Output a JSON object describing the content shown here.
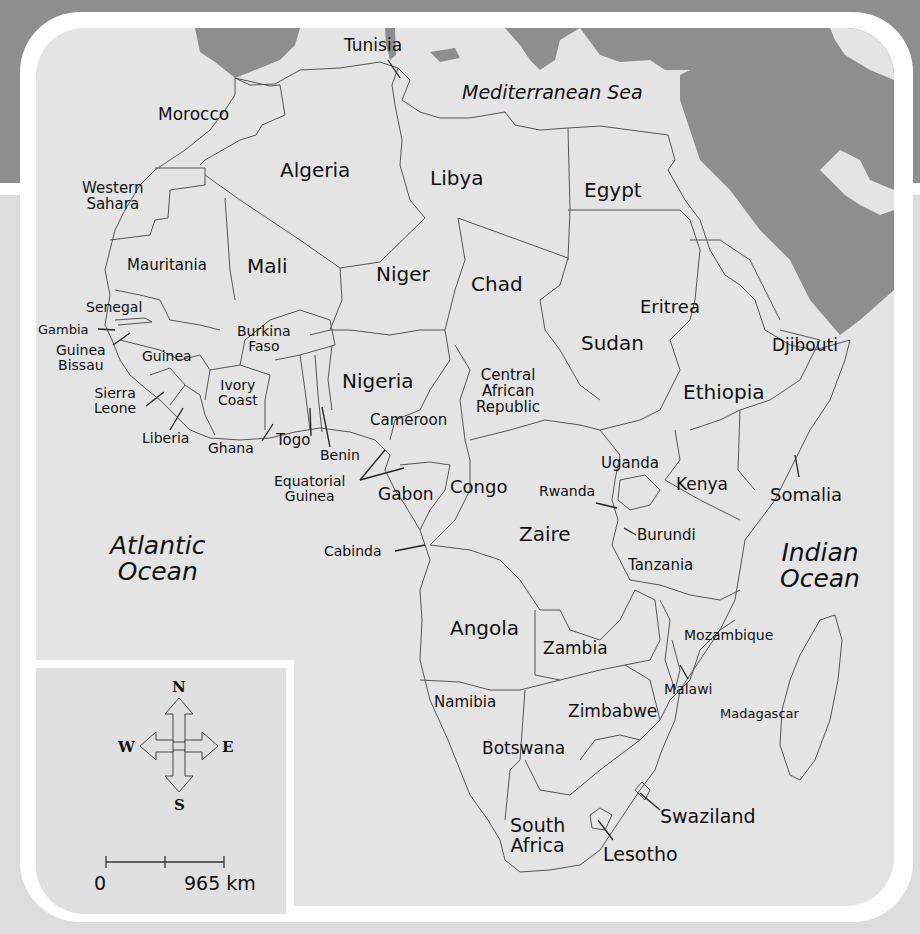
{
  "map": {
    "title": "Africa",
    "colors": {
      "water": "#8e8e8e",
      "land": "#e4e4e4",
      "frame": "#ffffff",
      "border": "#555555",
      "text": "#111111"
    },
    "water_labels": {
      "mediterranean": "Mediterranean Sea",
      "atlantic": [
        "Atlantic",
        "Ocean"
      ],
      "indian": [
        "Indian",
        "Ocean"
      ]
    },
    "countries": {
      "tunisia": "Tunisia",
      "morocco": "Morocco",
      "algeria": "Algeria",
      "libya": "Libya",
      "egypt": "Egypt",
      "western_sahara": [
        "Western",
        "Sahara"
      ],
      "mauritania": "Mauritania",
      "mali": "Mali",
      "niger": "Niger",
      "chad": "Chad",
      "eritrea": "Eritrea",
      "sudan": "Sudan",
      "djibouti": "Djibouti",
      "senegal": "Senegal",
      "gambia": "Gambia",
      "guinea_bissau": [
        "Guinea",
        "Bissau"
      ],
      "guinea": "Guinea",
      "burkina_faso": [
        "Burkina",
        "Faso"
      ],
      "sierra_leone": [
        "Sierra",
        "Leone"
      ],
      "ivory_coast": [
        "Ivory",
        "Coast"
      ],
      "nigeria": "Nigeria",
      "central_african_republic": [
        "Central",
        "African",
        "Republic"
      ],
      "ethiopia": "Ethiopia",
      "liberia": "Liberia",
      "ghana": "Ghana",
      "togo": "Togo",
      "benin": "Benin",
      "cameroon": "Cameroon",
      "equatorial_guinea": [
        "Equatorial",
        "Guinea"
      ],
      "gabon": "Gabon",
      "congo": "Congo",
      "uganda": "Uganda",
      "rwanda": "Rwanda",
      "kenya": "Kenya",
      "somalia": "Somalia",
      "zaire": "Zaire",
      "burundi": "Burundi",
      "tanzania": "Tanzania",
      "cabinda": "Cabinda",
      "angola": "Angola",
      "zambia": "Zambia",
      "mozambique": "Mozambique",
      "malawi": "Malawi",
      "namibia": "Namibia",
      "zimbabwe": "Zimbabwe",
      "madagascar": "Madagascar",
      "botswana": "Botswana",
      "swaziland": "Swaziland",
      "south_africa": [
        "South",
        "Africa"
      ],
      "lesotho": "Lesotho"
    },
    "compass": {
      "n": "N",
      "s": "S",
      "e": "E",
      "w": "W"
    },
    "scale": {
      "start": "0",
      "end": "965 km"
    }
  }
}
